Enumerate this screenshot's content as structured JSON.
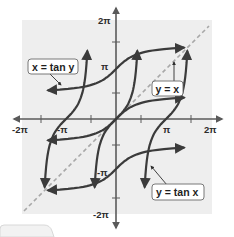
{
  "chart_data": {
    "type": "line",
    "title": "",
    "xlabel": "",
    "ylabel": "",
    "xlim": [
      -6.2832,
      6.2832
    ],
    "ylim": [
      -6.2832,
      6.2832
    ],
    "grid": false,
    "legend": "none (inline callout labels)",
    "x_tick_labels": [
      "-2π",
      "-π",
      "π",
      "2π"
    ],
    "y_tick_labels": [
      "2π",
      "π",
      "-π",
      "-2π"
    ],
    "minor_ticks": [
      "-3π/2",
      "-π/2",
      "π/2",
      "3π/2"
    ],
    "series": [
      {
        "name": "y = tan x",
        "style": "solid",
        "color": "#3b3b3b",
        "description": "tangent branches with vertical asymptotes at x = ±π/2, ±3π/2",
        "branches": [
          {
            "x_range": [
              -4.6,
              -1.72
            ],
            "center": -3.1416
          },
          {
            "x_range": [
              -1.42,
              1.42
            ],
            "center": 0
          },
          {
            "x_range": [
              1.72,
              4.6
            ],
            "center": 3.1416
          }
        ],
        "sample_points": [
          [
            -3.1416,
            0
          ],
          [
            0,
            0
          ],
          [
            3.1416,
            0
          ],
          [
            0.785,
            1
          ],
          [
            -0.785,
            -1
          ]
        ]
      },
      {
        "name": "x = tan y",
        "style": "solid",
        "color": "#3b3b3b",
        "description": "arctangent branches (inverse relation), horizontal asymptotes at y = ±π/2, ±3π/2",
        "branches": [
          {
            "y_range": [
              -4.6,
              -1.72
            ],
            "center": -3.1416
          },
          {
            "y_range": [
              -1.42,
              1.42
            ],
            "center": 0
          },
          {
            "y_range": [
              1.72,
              4.6
            ],
            "center": 3.1416
          }
        ],
        "sample_points": [
          [
            0,
            -3.1416
          ],
          [
            0,
            0
          ],
          [
            0,
            3.1416
          ],
          [
            1,
            0.785
          ],
          [
            -1,
            -0.785
          ]
        ]
      },
      {
        "name": "y = x",
        "style": "dashed",
        "color": "#a8a8a8",
        "x": [
          -5.9,
          5.9
        ],
        "y": [
          -5.9,
          5.9
        ]
      }
    ],
    "annotations": [
      "x = tan y",
      "y = x",
      "y = tan x"
    ]
  },
  "labels": {
    "x_ticks": {
      "neg2pi": "-2π",
      "negpi": "-π",
      "pi": "π",
      "pos2pi": "2π"
    },
    "y_ticks": {
      "pos2pi": "2π",
      "pi": "π",
      "negpi": "-π",
      "neg2pi": "-2π"
    },
    "callouts": {
      "x_tan_y": "x = tan y",
      "y_eq_x": "y = x",
      "y_tan_x": "y = tan x"
    }
  },
  "colors": {
    "plot_background": "#eeeeee",
    "curve": "#3b3b3b",
    "identity_line": "#a8a8a8",
    "axis": "#5a5a5a"
  }
}
